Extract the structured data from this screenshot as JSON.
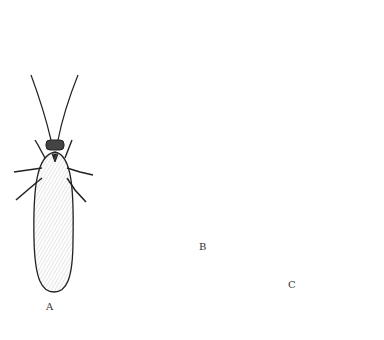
{
  "figure": {
    "labels": {
      "a": "A",
      "b": "B",
      "c": "C"
    },
    "specimens": [
      {
        "id": "A",
        "description": "winged termite (alate) with long antennae"
      },
      {
        "id": "B",
        "description": "worker termite"
      },
      {
        "id": "C",
        "description": "queen termite with swollen abdomen"
      }
    ]
  }
}
